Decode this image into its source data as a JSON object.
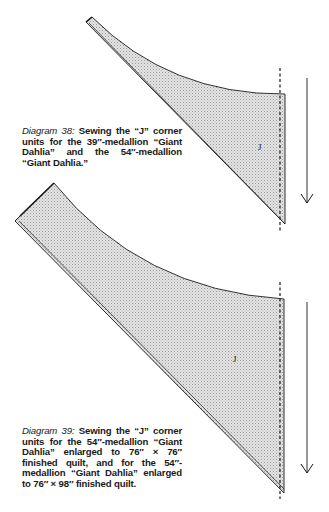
{
  "diagrams": [
    {
      "id": "38",
      "caption_lead": "Diagram 38:",
      "caption_body": "Sewing the “J” corner units for the 39″-medallion “Giant Dahlia” and the 54″-medallion “Giant Dahlia.”",
      "piece_label": "J",
      "arrow_direction": "down",
      "seam_line": "dashed"
    },
    {
      "id": "39",
      "caption_lead": "Diagram 39:",
      "caption_body": "Sewing the “J” corner units for the 54″-medallion “Giant Dahlia” enlarged to 76″ × 76″ finished quilt, and for the 54″-medallion “Giant Dahlia” enlarged to 76″ × 98″ finished quilt.",
      "piece_label": "J",
      "arrow_direction": "down",
      "seam_line": "dashed"
    }
  ],
  "colors": {
    "fill": "#d6d6d6",
    "stroke": "#1a1a1a",
    "background": "#ffffff"
  }
}
